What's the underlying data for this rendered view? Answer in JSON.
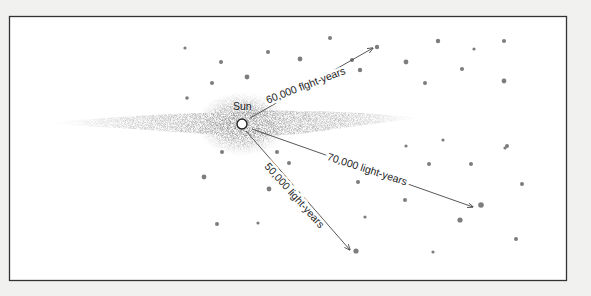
{
  "diagram": {
    "title": "",
    "frame": {
      "x": 9,
      "y": 16,
      "width": 557,
      "height": 264,
      "stroke": "#333333",
      "fill": "#ffffff"
    },
    "galaxy": {
      "center": {
        "x": 242,
        "y": 124
      },
      "disk_half_length_left": 190,
      "disk_half_length_right": 180,
      "disk_half_thickness": 9,
      "bulge_rx": 44,
      "bulge_ry": 30,
      "color": "#8a8a8a"
    },
    "sun": {
      "label": "Sun",
      "x": 242,
      "y": 124,
      "r": 5
    },
    "arrows": [
      {
        "name": "arrow-60000",
        "label": "60,000 flght-years",
        "from": {
          "x": 250,
          "y": 118
        },
        "to": {
          "x": 373,
          "y": 48
        },
        "label_x": 306,
        "label_y": 86,
        "angle": -21
      },
      {
        "name": "arrow-70000",
        "label": "70,000 light-years",
        "from": {
          "x": 252,
          "y": 129
        },
        "to": {
          "x": 473,
          "y": 207
        },
        "label_x": 367,
        "label_y": 170,
        "angle": 18
      },
      {
        "name": "arrow-50000",
        "label": "50,000 light-years",
        "from": {
          "x": 246,
          "y": 131
        },
        "to": {
          "x": 350,
          "y": 250
        },
        "label_x": 294,
        "label_y": 196,
        "angle": 48
      }
    ],
    "clusters": [
      {
        "x": 185,
        "y": 48,
        "r": 1.6
      },
      {
        "x": 221,
        "y": 62,
        "r": 2.0
      },
      {
        "x": 268,
        "y": 52,
        "r": 2.0
      },
      {
        "x": 330,
        "y": 38,
        "r": 2.0
      },
      {
        "x": 212,
        "y": 83,
        "r": 2.0
      },
      {
        "x": 247,
        "y": 77,
        "r": 2.4
      },
      {
        "x": 187,
        "y": 98,
        "r": 1.8
      },
      {
        "x": 300,
        "y": 59,
        "r": 2.4
      },
      {
        "x": 352,
        "y": 60,
        "r": 2.0
      },
      {
        "x": 377,
        "y": 47,
        "r": 2.2
      },
      {
        "x": 360,
        "y": 70,
        "r": 2.2
      },
      {
        "x": 406,
        "y": 62,
        "r": 2.4
      },
      {
        "x": 438,
        "y": 41,
        "r": 2.2
      },
      {
        "x": 474,
        "y": 49,
        "r": 1.6
      },
      {
        "x": 504,
        "y": 41,
        "r": 2.0
      },
      {
        "x": 462,
        "y": 69,
        "r": 2.0
      },
      {
        "x": 504,
        "y": 81,
        "r": 2.4
      },
      {
        "x": 425,
        "y": 83,
        "r": 2.0
      },
      {
        "x": 443,
        "y": 140,
        "r": 1.6
      },
      {
        "x": 507,
        "y": 146,
        "r": 2.0
      },
      {
        "x": 222,
        "y": 152,
        "r": 2.0
      },
      {
        "x": 277,
        "y": 152,
        "r": 2.0
      },
      {
        "x": 289,
        "y": 163,
        "r": 2.0
      },
      {
        "x": 204,
        "y": 177,
        "r": 2.4
      },
      {
        "x": 269,
        "y": 189,
        "r": 2.4
      },
      {
        "x": 217,
        "y": 224,
        "r": 2.0
      },
      {
        "x": 258,
        "y": 223,
        "r": 1.6
      },
      {
        "x": 358,
        "y": 182,
        "r": 2.0
      },
      {
        "x": 405,
        "y": 200,
        "r": 2.0
      },
      {
        "x": 429,
        "y": 164,
        "r": 2.0
      },
      {
        "x": 471,
        "y": 164,
        "r": 2.0
      },
      {
        "x": 522,
        "y": 184,
        "r": 2.0
      },
      {
        "x": 481,
        "y": 205,
        "r": 2.8
      },
      {
        "x": 460,
        "y": 220,
        "r": 2.6
      },
      {
        "x": 516,
        "y": 239,
        "r": 2.0
      },
      {
        "x": 356,
        "y": 251,
        "r": 2.6
      },
      {
        "x": 433,
        "y": 252,
        "r": 1.6
      },
      {
        "x": 365,
        "y": 217,
        "r": 1.6
      },
      {
        "x": 406,
        "y": 146,
        "r": 1.6
      },
      {
        "x": 505,
        "y": 148,
        "r": 1.6
      }
    ],
    "cluster_color": "#7d7d7d",
    "arrow_color": "#444444"
  }
}
